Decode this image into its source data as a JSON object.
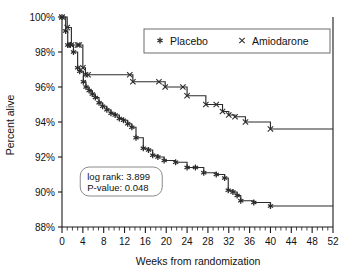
{
  "chart_data": {
    "type": "line",
    "title": "",
    "subtitle": "",
    "xlabel": "Weeks from randomization",
    "ylabel": "Percent alive",
    "xlim": [
      0,
      52
    ],
    "ylim": [
      88,
      100
    ],
    "xticks": [
      0,
      4,
      8,
      12,
      16,
      20,
      24,
      28,
      32,
      36,
      40,
      44,
      48,
      52
    ],
    "xtick_labels": [
      "0",
      "4",
      "8",
      "12",
      "16",
      "20",
      "24",
      "28",
      "32",
      "36",
      "40",
      "44",
      "48",
      "52"
    ],
    "x_minor_interval": 1,
    "yticks": [
      88,
      90,
      92,
      94,
      96,
      98,
      100
    ],
    "ytick_labels": [
      "88%",
      "90%",
      "92%",
      "94%",
      "96%",
      "98%",
      "100%"
    ],
    "grid": false,
    "step_type": "post",
    "legend_position": "top-right",
    "series": [
      {
        "name": "Placebo",
        "marker": "asterisk",
        "color": "#2b2b2b",
        "x": [
          0,
          0.7,
          1.1,
          1.6,
          2.2,
          3.0,
          3.4,
          4.1,
          4.6,
          5.2,
          5.8,
          6.4,
          7.1,
          7.8,
          8.6,
          9.4,
          10.2,
          11.0,
          11.8,
          12.6,
          13.4,
          14.2,
          15.6,
          16.6,
          17.4,
          18.4,
          19.6,
          21.8,
          24.0,
          25.6,
          27.2,
          29.6,
          31.2,
          31.9,
          32.8,
          33.6,
          34.3,
          36.8,
          40.0,
          52.0
        ],
        "y": [
          100.0,
          99.2,
          98.4,
          98.4,
          98.0,
          97.1,
          96.9,
          96.3,
          96.0,
          95.8,
          95.6,
          95.4,
          95.1,
          94.9,
          94.7,
          94.5,
          94.4,
          94.2,
          94.1,
          93.9,
          93.7,
          93.1,
          92.5,
          92.4,
          92.1,
          92.0,
          91.8,
          91.7,
          91.4,
          91.4,
          91.1,
          91.0,
          90.8,
          90.1,
          90.0,
          89.8,
          89.5,
          89.4,
          89.2,
          89.2
        ]
      },
      {
        "name": "Amiodarone",
        "marker": "cross",
        "color": "#2b2b2b",
        "x": [
          0,
          1.0,
          1.8,
          3.0,
          3.3,
          4.0,
          4.5,
          5.0,
          13.0,
          13.6,
          18.6,
          19.8,
          23.2,
          24.0,
          27.6,
          29.6,
          30.8,
          32.0,
          33.2,
          35.2,
          40.0,
          52.0
        ],
        "y": [
          100.0,
          99.4,
          98.4,
          98.4,
          98.4,
          97.1,
          96.7,
          96.7,
          96.7,
          96.3,
          96.3,
          96.0,
          96.0,
          95.5,
          95.0,
          95.0,
          94.6,
          94.4,
          94.3,
          94.0,
          93.6,
          93.6
        ]
      }
    ],
    "annotations": [
      {
        "name": "statistics-box",
        "lines": [
          "log rank: 3.899",
          "P-value:  0.048"
        ],
        "x": 3.5,
        "y": 90.6
      }
    ]
  },
  "legend": {
    "entries": [
      {
        "marker_name": "asterisk-marker-icon",
        "label": "Placebo"
      },
      {
        "marker_name": "cross-marker-icon",
        "label": "Amiodarone"
      }
    ]
  }
}
